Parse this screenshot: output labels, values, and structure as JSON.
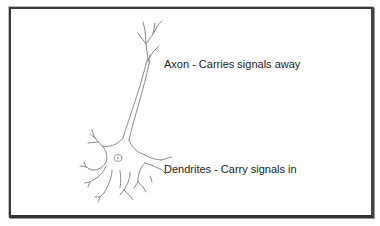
{
  "diagram": {
    "labels": {
      "axon": "Axon - Carries signals away",
      "dendrites": "Dendrites - Carry signals in"
    },
    "colors": {
      "frame": "#333333",
      "drawing": "#8a8a8a",
      "text": "#222222",
      "background": "#ffffff"
    }
  }
}
